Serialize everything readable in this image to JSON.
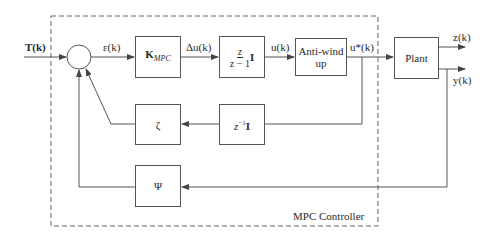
{
  "diagram": {
    "controller_label": "MPC Controller",
    "input_signal": "T(k)",
    "signals": {
      "error": "ε(k)",
      "delta_u": "Δu(k)",
      "u": "u(k)",
      "u_star": "u*(k)",
      "z_out": "z(k)",
      "y_out": "y(k)"
    },
    "blocks": {
      "kmpc": {
        "main": "K",
        "sub": "MPC"
      },
      "integrator": {
        "num": "z",
        "den": "z − 1",
        "suffix": "I"
      },
      "antiwindup": {
        "line1": "Anti-wind",
        "line2": "up"
      },
      "plant": "Plant",
      "zeta": "ζ",
      "delay": {
        "base": "z",
        "exp": "−1",
        "suffix": "I"
      },
      "psi": "Ψ"
    },
    "colors": {
      "line": "#555555",
      "dashed": "#666666"
    }
  }
}
